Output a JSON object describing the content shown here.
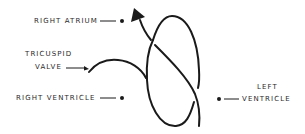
{
  "diagram": {
    "labels": {
      "right_atrium": "RIGHT  ATRIUM",
      "tricuspid_valve_line1": "TRICUSPID",
      "tricuspid_valve_line2": "VALVE",
      "right_ventricle": "RIGHT  VENTRICLE",
      "left_ventricle_line1": "LEFT",
      "left_ventricle_line2": "VENTRICLE"
    },
    "colors": {
      "stroke": "#1a1a1a",
      "text": "#2a2a2a",
      "background": "#ffffff"
    }
  }
}
